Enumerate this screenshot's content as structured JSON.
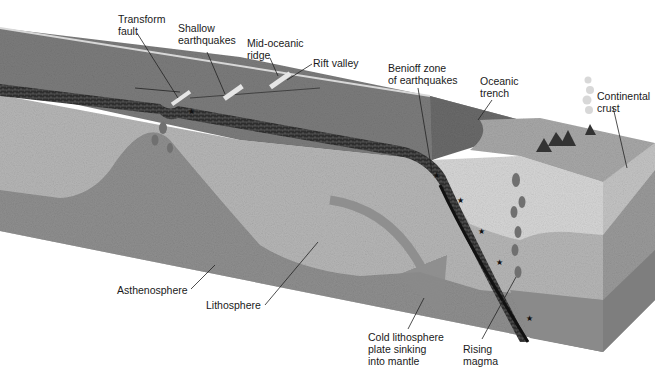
{
  "diagram": {
    "labels": {
      "transform_fault": "Transform\nfault",
      "shallow_earthquakes": "Shallow\nearthquakes",
      "mid_oceanic_ridge": "Mid-oceanic\nridge",
      "rift_valley": "Rift valley",
      "benioff_zone": "Benioff zone\nof earthquakes",
      "oceanic_trench": "Oceanic\ntrench",
      "continental_crust": "Continental\ncrust",
      "asthenosphere": "Asthenosphere",
      "lithosphere": "Lithosphere",
      "cold_lithosphere": "Cold lithosphere\nplate sinking\ninto mantle",
      "rising_magma": "Rising\nmagma"
    },
    "colors": {
      "background": "#ffffff",
      "ocean_floor": "#7a7a7a",
      "lithosphere_band": "#3a3a3a",
      "mantle_light": "#b4b4b4",
      "mantle_dark": "#8e8e8e",
      "continental_crust": "#d4d4d4",
      "subducting_slab": "#1c1c1c",
      "label_text": "#1a1a1a"
    }
  }
}
